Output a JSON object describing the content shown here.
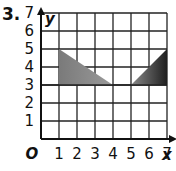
{
  "problem_number": "3.",
  "chart_data": {
    "type": "coordinate-grid",
    "title": "",
    "xlabel": "x",
    "ylabel": "y",
    "origin_label": "O",
    "xlim": [
      0,
      7
    ],
    "ylim": [
      0,
      7
    ],
    "x_ticks": [
      "1",
      "2",
      "3",
      "4",
      "5",
      "6",
      "7"
    ],
    "y_ticks": [
      "1",
      "2",
      "3",
      "4",
      "5",
      "6",
      "7"
    ],
    "grid": true,
    "shapes": [
      {
        "name": "left-triangle",
        "vertices": [
          [
            1,
            3
          ],
          [
            1,
            5
          ],
          [
            4,
            3
          ]
        ],
        "fill": "#808080"
      },
      {
        "name": "right-triangle",
        "vertices": [
          [
            5,
            3
          ],
          [
            7,
            3
          ],
          [
            7,
            5
          ]
        ],
        "fill": "#3a3a3a"
      }
    ]
  }
}
